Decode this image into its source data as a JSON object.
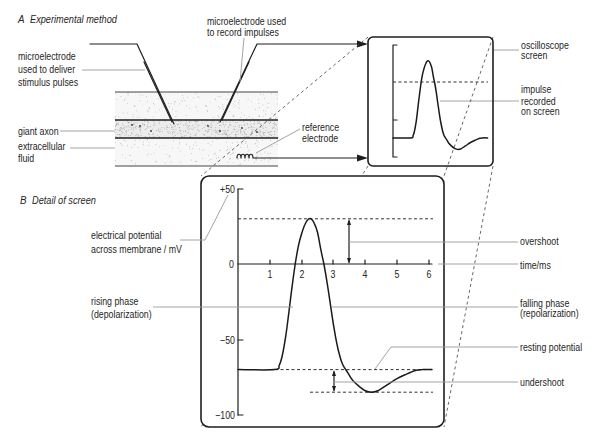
{
  "panel_a": {
    "letter": "A",
    "title": "Experimental method",
    "labels": {
      "stim_electrode": [
        "microelectrode",
        "used to deliver",
        "stimulus pulses"
      ],
      "record_electrode": [
        "microelectrode used",
        "to record impulses"
      ],
      "giant_axon": "giant axon",
      "extracellular_fluid": [
        "extracellular",
        "fluid"
      ],
      "reference_electrode": [
        "reference",
        "electrode"
      ],
      "oscilloscope_screen": [
        "oscilloscope",
        "screen"
      ],
      "impulse_recorded": [
        "impulse",
        "recorded",
        "on screen"
      ]
    }
  },
  "panel_b": {
    "letter": "B",
    "title": "Detail of screen",
    "y_axis_label": [
      "electrical potential",
      "across membrane / mV"
    ],
    "y_ticks": [
      "+50",
      "0",
      "−50",
      "−100"
    ],
    "x_ticks": [
      "1",
      "2",
      "3",
      "4",
      "5",
      "6"
    ],
    "x_axis_label": "time/ms",
    "annotations": {
      "overshoot": "overshoot",
      "rising_phase": [
        "rising phase",
        "(depolarization)"
      ],
      "falling_phase": [
        "falling phase",
        "(repolarization)"
      ],
      "resting_potential": "resting potential",
      "undershoot": "undershoot"
    }
  },
  "chart_data": {
    "type": "line",
    "title": "Detail of screen",
    "xlabel": "time/ms",
    "ylabel": "electrical potential across membrane / mV",
    "xlim": [
      0,
      6
    ],
    "ylim": [
      -100,
      50
    ],
    "x_ticks": [
      1,
      2,
      3,
      4,
      5,
      6
    ],
    "y_ticks": [
      50,
      0,
      -50,
      -100
    ],
    "grid": false,
    "reference_lines": {
      "peak": 30,
      "resting": -70,
      "undershoot": -85
    },
    "series": [
      {
        "name": "action potential",
        "points": [
          [
            0,
            -70
          ],
          [
            1.15,
            -70
          ],
          [
            1.3,
            -67
          ],
          [
            1.4,
            -60
          ],
          [
            1.5,
            -48
          ],
          [
            1.6,
            -32
          ],
          [
            1.7,
            -15
          ],
          [
            1.8,
            0
          ],
          [
            1.9,
            12
          ],
          [
            2.0,
            20
          ],
          [
            2.1,
            26
          ],
          [
            2.2,
            29.5
          ],
          [
            2.3,
            30
          ],
          [
            2.4,
            27
          ],
          [
            2.5,
            21
          ],
          [
            2.6,
            10
          ],
          [
            2.7,
            0
          ],
          [
            2.8,
            -12
          ],
          [
            2.9,
            -26
          ],
          [
            3.0,
            -40
          ],
          [
            3.1,
            -52
          ],
          [
            3.2,
            -61
          ],
          [
            3.3,
            -67
          ],
          [
            3.45,
            -72
          ],
          [
            3.6,
            -77
          ],
          [
            3.8,
            -81
          ],
          [
            4.0,
            -84
          ],
          [
            4.2,
            -85
          ],
          [
            4.4,
            -84
          ],
          [
            4.7,
            -80
          ],
          [
            5.0,
            -76
          ],
          [
            5.3,
            -73
          ],
          [
            5.6,
            -70.5
          ],
          [
            5.8,
            -70
          ],
          [
            6.1,
            -70
          ]
        ]
      }
    ]
  }
}
